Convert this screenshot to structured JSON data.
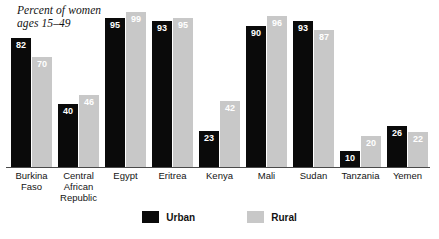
{
  "chart_data": {
    "type": "bar",
    "title": "Percent of women\nages 15–49",
    "xlabel": "",
    "ylabel": "",
    "ylim": [
      0,
      100
    ],
    "grid": false,
    "legend_position": "bottom-center",
    "categories": [
      "Burkina\nFaso",
      "Central\nAfrican\nRepublic",
      "Egypt",
      "Eritrea",
      "Kenya",
      "Mali",
      "Sudan",
      "Tanzania",
      "Yemen"
    ],
    "series": [
      {
        "name": "Urban",
        "color": "#0a0a0a",
        "values": [
          82,
          40,
          95,
          93,
          23,
          90,
          93,
          10,
          26
        ]
      },
      {
        "name": "Rural",
        "color": "#c8c8c8",
        "values": [
          70,
          46,
          99,
          95,
          42,
          96,
          87,
          20,
          22
        ]
      }
    ]
  },
  "legend": {
    "items": [
      {
        "label": "Urban",
        "color": "#0a0a0a"
      },
      {
        "label": "Rural",
        "color": "#c8c8c8"
      }
    ]
  }
}
